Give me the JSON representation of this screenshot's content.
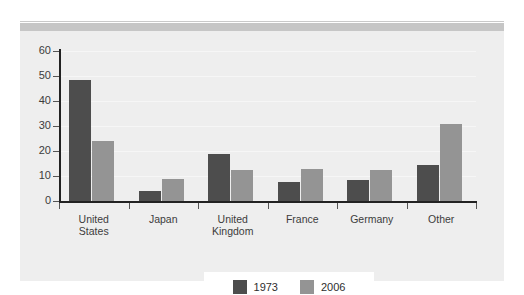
{
  "chart_data": {
    "type": "bar",
    "title": "",
    "subtitle": "",
    "xlabel": "",
    "ylabel": "",
    "ylim": [
      0,
      60
    ],
    "yticks": [
      0,
      10,
      20,
      30,
      40,
      50,
      60
    ],
    "grid": true,
    "legend_position": "bottom",
    "categories": [
      "United States",
      "Japan",
      "United Kingdom",
      "France",
      "Germany",
      "Other"
    ],
    "category_lines": [
      [
        "United",
        "States"
      ],
      [
        "Japan"
      ],
      [
        "United",
        "Kingdom"
      ],
      [
        "France"
      ],
      [
        "Germany"
      ],
      [
        "Other"
      ]
    ],
    "series": [
      {
        "name": "1973",
        "color": "#4d4d4d",
        "values": [
          48.5,
          4,
          19,
          7.5,
          8.5,
          14.5
        ]
      },
      {
        "name": "2006",
        "color": "#949494",
        "values": [
          24,
          9,
          12.5,
          13,
          12.5,
          31
        ]
      }
    ]
  },
  "legend": {
    "items": [
      {
        "label": "1973",
        "color": "#4d4d4d"
      },
      {
        "label": "2006",
        "color": "#949494"
      }
    ]
  },
  "axis": {
    "y_tick_labels": [
      "60",
      "50",
      "40",
      "30",
      "20",
      "10",
      "0"
    ]
  },
  "colors": {
    "panel_background": "#eeeeee",
    "page_background": "#ffffff",
    "header_band": "#c6c6c6",
    "axis_line": "#222222",
    "series_1973": "#4d4d4d",
    "series_2006": "#949494"
  }
}
